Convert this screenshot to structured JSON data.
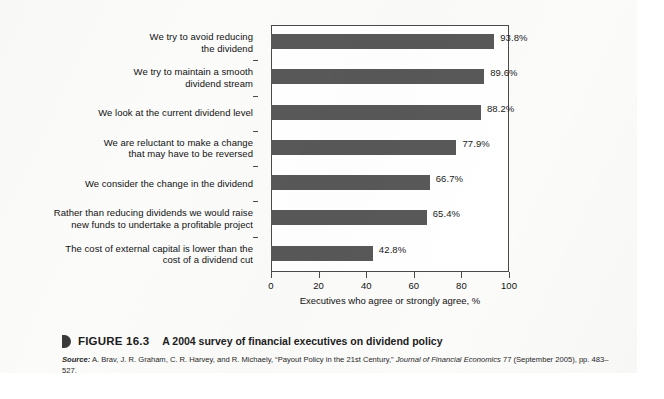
{
  "chart_data": {
    "type": "bar",
    "orientation": "horizontal",
    "title": "",
    "xlabel": "Executives who agree or strongly agree, %",
    "ylabel": "",
    "xlim": [
      0,
      100
    ],
    "xticks": [
      0,
      20,
      40,
      60,
      80,
      100
    ],
    "grid": false,
    "legend": false,
    "bar_color": "#585858",
    "categories": [
      "We try to avoid reducing\nthe dividend",
      "We try to maintain a smooth\ndividend stream",
      "We look at the current dividend level",
      "We are reluctant to make a change\nthat may have to be reversed",
      "We consider the change in the dividend",
      "Rather than reducing dividends we would raise\nnew funds to undertake a profitable project",
      "The cost of external capital is lower than the\ncost of a dividend cut"
    ],
    "values": [
      93.8,
      89.6,
      88.2,
      77.9,
      66.7,
      65.4,
      42.8
    ],
    "value_labels": [
      "93.8%",
      "89.6%",
      "88.2%",
      "77.9%",
      "66.7%",
      "65.4%",
      "42.8%"
    ]
  },
  "caption": {
    "figure_number": "FIGURE 16.3",
    "figure_title": "A 2004 survey of financial executives on dividend policy",
    "source_label": "Source:",
    "source_text_before_journal": " A. Brav, J. R. Graham, C. R. Harvey, and R. Michaely, “Payout Policy in the 21st Century,” ",
    "source_journal": "Journal of Financial Economics",
    "source_text_after_journal": " 77 (September 2005), pp. 483–527."
  }
}
